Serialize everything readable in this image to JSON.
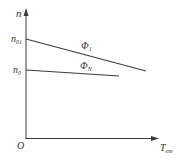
{
  "diagram": {
    "axes": {
      "y_label": "n",
      "x_label_main": "T",
      "x_label_sub": "em",
      "origin_label": "O"
    },
    "y_ticks": [
      {
        "label_main": "n",
        "label_sub": "01",
        "y": 39
      },
      {
        "label_main": "n",
        "label_sub": "0",
        "y": 70
      }
    ],
    "lines": [
      {
        "name": "Φ1",
        "label_main": "Φ",
        "label_sub": "1",
        "x1": 26,
        "y1": 39,
        "x2": 146,
        "y2": 71
      },
      {
        "name": "ΦN",
        "label_main": "Φ",
        "label_sub": "N",
        "x1": 26,
        "y1": 70,
        "x2": 119,
        "y2": 76
      }
    ],
    "colors": {
      "line": "#3a3a3a",
      "text": "#333333"
    }
  }
}
